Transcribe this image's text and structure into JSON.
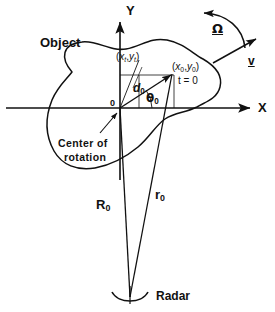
{
  "figure": {
    "domain": "Diagram",
    "background_color": "#ffffff",
    "stroke_color": "#111111",
    "width": 275,
    "height": 312
  },
  "axes": {
    "x_label": "X",
    "y_label": "Y",
    "origin_label": "0",
    "origin_x": 120,
    "origin_y": 108
  },
  "labels": {
    "object": "Object",
    "center_of_rotation_line1": "Center of",
    "center_of_rotation_line2": "rotation",
    "radar": "Radar",
    "omega": "Ω",
    "velocity": "v",
    "point_t_x": "x",
    "point_t_x_sub": "t",
    "point_t_y": "y",
    "point_t_y_sub": "t",
    "point_0_x": "x",
    "point_0_x_sub": "0",
    "point_0_y": "y",
    "point_0_y_sub": "0",
    "time_zero": "t = 0",
    "distance_d": "d",
    "distance_d_sub": "0",
    "angle_theta": "θ",
    "angle_theta_sub": "0",
    "range_R": "R",
    "range_R_sub": "0",
    "range_r": "r",
    "range_r_sub": "0",
    "paren_open": "(",
    "paren_close": ")",
    "comma": ","
  },
  "geometry": {
    "object_outline": "M 72 72 C 60 58, 62 44, 80 42 C 96 40, 110 50, 124 48 C 140 46, 150 38, 166 40 C 182 42, 192 52, 202 58 C 214 65, 222 74, 220 86 C 218 98, 206 102, 198 106 C 186 112, 176 112, 166 118 C 156 124, 150 136, 138 146 C 126 156, 112 164, 96 168 C 78 172, 62 166, 54 152 C 44 134, 46 116, 52 100 C 58 86, 66 80, 72 72 Z",
    "x_axis": {
      "x1": 6,
      "y1": 108,
      "x2": 256,
      "y2": 108
    },
    "y_axis": {
      "x1": 120,
      "y1": 178,
      "x2": 120,
      "y2": 18
    },
    "point_t": {
      "x": 138,
      "y": 75
    },
    "point_0": {
      "x": 172,
      "y": 73
    },
    "radar_point": {
      "x": 130,
      "y": 298
    },
    "R0_vector": {
      "x1": 130,
      "y1": 298,
      "x2": 120,
      "y2": 108
    },
    "r0_vector": {
      "x1": 130,
      "y1": 298,
      "x2": 172,
      "y2": 73
    },
    "d0_line": {
      "x1": 120,
      "y1": 108,
      "x2": 138,
      "y2": 60
    },
    "theta0_arc_radius": 30,
    "omega_arc": "M 243 45 C 240 26, 225 13, 202 12",
    "velocity_arrow": {
      "x1": 214,
      "y1": 62,
      "x2": 258,
      "y2": 38
    },
    "center_pointer": {
      "x1": 104,
      "y1": 130,
      "x2": 120,
      "y2": 112
    },
    "point_t_leader": {
      "x1": 140,
      "y1": 66,
      "x2": 132,
      "y2": 86
    },
    "construction_lines": [
      {
        "x1": 120,
        "y1": 75,
        "x2": 172,
        "y2": 75
      },
      {
        "x1": 172,
        "y1": 75,
        "x2": 172,
        "y2": 108
      },
      {
        "x1": 138,
        "y1": 75,
        "x2": 138,
        "y2": 108
      },
      {
        "x1": 120,
        "y1": 108,
        "x2": 138,
        "y2": 75
      }
    ]
  }
}
